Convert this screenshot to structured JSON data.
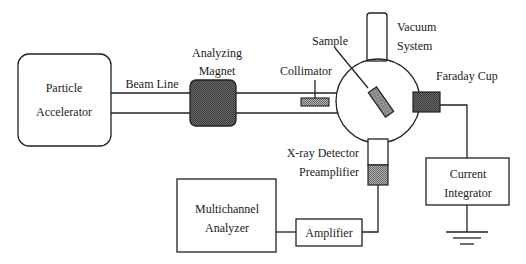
{
  "diagram": {
    "colors": {
      "line": "#222222",
      "hatch_dark": "#555555",
      "hatch_medium": "#8a8a8a",
      "background": "#ffffff"
    },
    "components": {
      "particle_accelerator": {
        "line1": "Particle",
        "line2": "Accelerator"
      },
      "beam_line": {
        "label": "Beam Line"
      },
      "analyzing_magnet": {
        "line1": "Analyzing",
        "line2": "Magnet"
      },
      "collimator": {
        "label": "Collimator"
      },
      "sample": {
        "label": "Sample"
      },
      "vacuum_system": {
        "line1": "Vacuum",
        "line2": "System"
      },
      "faraday_cup": {
        "label": "Faraday Cup"
      },
      "xray_detector": {
        "line1": "X-ray Detector",
        "line2": "Preamplifier"
      },
      "current_integrator": {
        "line1": "Current",
        "line2": "Integrator"
      },
      "multichannel_analyzer": {
        "line1": "Multichannel",
        "line2": "Analyzer"
      },
      "amplifier": {
        "label": "Amplifier"
      }
    }
  }
}
